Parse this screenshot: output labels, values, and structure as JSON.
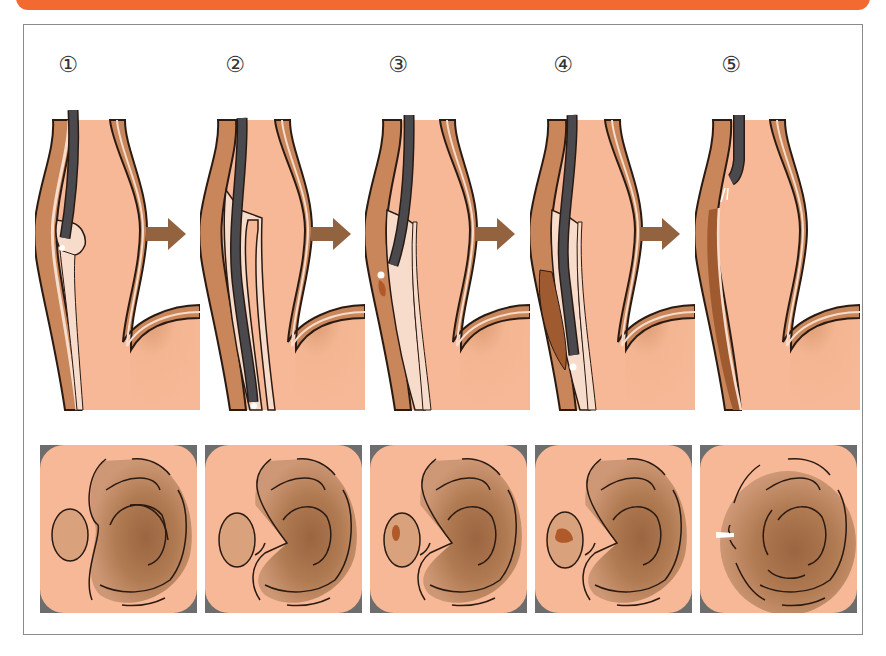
{
  "diagram": {
    "colors": {
      "header_banner": "#f26a30",
      "frame_border": "#8a8a8a",
      "tissue_light": "#f6b896",
      "tissue_wall": "#c8865a",
      "submucosa": "#f8dccb",
      "lumen_dark": "#a8724a",
      "scope": "#4a4a4e",
      "outline": "#2a1a12",
      "arrow": "#93623f",
      "lesion": "#b05a2a",
      "corner_mask": "#6d6d6d"
    },
    "steps": [
      {
        "number": "①",
        "label": "1"
      },
      {
        "number": "②",
        "label": "2"
      },
      {
        "number": "③",
        "label": "3"
      },
      {
        "number": "④",
        "label": "4"
      },
      {
        "number": "⑤",
        "label": "5"
      }
    ],
    "arrows": [
      "→",
      "→",
      "→",
      "→"
    ]
  }
}
